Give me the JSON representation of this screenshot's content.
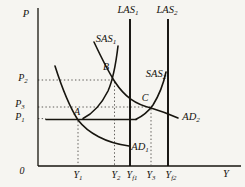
{
  "figure": {
    "colors": {
      "background": "#f6f5f1",
      "ink": "#17150f",
      "guide": "#4c4a45"
    },
    "axes": {
      "y_axis": {
        "main": "P"
      },
      "x_axis": {
        "main": "Y"
      },
      "origin": {
        "main": "0"
      }
    },
    "price_ticks": {
      "p2": {
        "main": "P",
        "sub": "2"
      },
      "p3": {
        "main": "P",
        "sub": "3"
      },
      "p1": {
        "main": "P",
        "sub": "1"
      }
    },
    "output_ticks": {
      "y1": {
        "main": "Y",
        "sub": "1"
      },
      "y2": {
        "main": "Y",
        "sub": "2"
      },
      "yf1": {
        "main": "Y",
        "sub": "f1"
      },
      "y3": {
        "main": "Y",
        "sub": "3"
      },
      "yf2": {
        "main": "Y",
        "sub": "f2"
      }
    },
    "curves": {
      "las1": {
        "main": "LAS",
        "sub": "1"
      },
      "las2": {
        "main": "LAS",
        "sub": "2"
      },
      "sas1": {
        "main": "SAS",
        "sub": "1"
      },
      "sas2": {
        "main": "SAS",
        "sub": "2"
      },
      "ad1": {
        "main": "AD",
        "sub": "1"
      },
      "ad2": {
        "main": "AD",
        "sub": "2"
      }
    },
    "points": {
      "a": {
        "main": "A",
        "at_x": "Y1",
        "at_y": "P1"
      },
      "b": {
        "main": "B",
        "at_x": "Y2",
        "at_y": "P2"
      },
      "c": {
        "main": "C",
        "at_x": "Y3",
        "at_y": "P3"
      }
    }
  }
}
